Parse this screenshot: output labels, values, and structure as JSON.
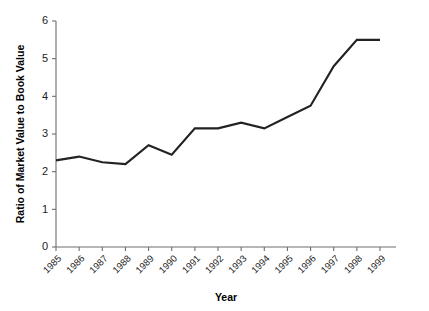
{
  "chart_data": {
    "type": "line",
    "title": "",
    "xlabel": "Year",
    "ylabel": "Ratio of Market Value to Book Value",
    "categories": [
      "1985",
      "1986",
      "1987",
      "1988",
      "1989",
      "1990",
      "1991",
      "1992",
      "1993",
      "1994",
      "1995",
      "1996",
      "1997",
      "1998",
      "1999"
    ],
    "values": [
      2.3,
      2.4,
      2.25,
      2.2,
      2.7,
      2.45,
      3.15,
      3.15,
      3.3,
      3.15,
      3.45,
      3.75,
      4.8,
      5.5,
      5.5
    ],
    "series": [
      {
        "name": "Ratio of Market Value to Book Value",
        "values": [
          2.3,
          2.4,
          2.25,
          2.2,
          2.7,
          2.45,
          3.15,
          3.15,
          3.3,
          3.15,
          3.45,
          3.75,
          4.8,
          5.5,
          5.5
        ]
      }
    ],
    "ylim": [
      0,
      6
    ],
    "yticks": [
      0,
      1,
      2,
      3,
      4,
      5,
      6
    ],
    "ytick_labels": [
      "0",
      "1",
      "2",
      "3",
      "4",
      "5",
      "6"
    ],
    "grid": false,
    "legend": false,
    "legend_position": "none",
    "line_color": "#222222",
    "axis_color": "#6e6e6e",
    "background_color": "#ffffff",
    "xtick_rotation": 45
  }
}
